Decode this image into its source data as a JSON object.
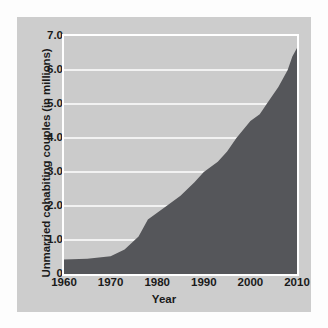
{
  "chart_data": {
    "type": "area",
    "title": "",
    "xlabel": "Year",
    "ylabel": "Unmarried cohabiting couples (in millions)",
    "xlim": [
      1960,
      2010
    ],
    "ylim": [
      0,
      7.0
    ],
    "grid": true,
    "legend": false,
    "xticklabels": [
      "1960",
      "1970",
      "1980",
      "1990",
      "2000",
      "2010"
    ],
    "xticks": [
      1960,
      1970,
      1980,
      1990,
      2000,
      2010
    ],
    "yticklabels": [
      "0",
      "1.0",
      "2.0",
      "3.0",
      "4.0",
      "5.0",
      "6.0",
      "7.0"
    ],
    "yticks": [
      0,
      1.0,
      2.0,
      3.0,
      4.0,
      5.0,
      6.0,
      7.0
    ],
    "x": [
      1960,
      1965,
      1970,
      1973,
      1976,
      1978,
      1980,
      1982,
      1985,
      1988,
      1990,
      1993,
      1995,
      1997,
      2000,
      2002,
      2004,
      2006,
      2008,
      2009,
      2010
    ],
    "values": [
      0.43,
      0.45,
      0.52,
      0.72,
      1.1,
      1.6,
      1.8,
      2.0,
      2.3,
      2.7,
      3.0,
      3.3,
      3.6,
      4.0,
      4.5,
      4.7,
      5.1,
      5.5,
      6.0,
      6.4,
      6.65
    ],
    "series": [
      {
        "name": "Unmarried cohabiting couples",
        "values": [
          0.43,
          0.45,
          0.52,
          0.72,
          1.1,
          1.6,
          1.8,
          2.0,
          2.3,
          2.7,
          3.0,
          3.3,
          3.6,
          4.0,
          4.5,
          4.7,
          5.1,
          5.5,
          6.0,
          6.4,
          6.65
        ]
      }
    ],
    "colors": {
      "area_fill": "#55565a",
      "plot_background": "#cbcbcb",
      "card_background": "#cdcdcd",
      "gridline": "#f2f2f2",
      "axis_border": "#ffffff",
      "text": "#1a1a1a"
    }
  }
}
